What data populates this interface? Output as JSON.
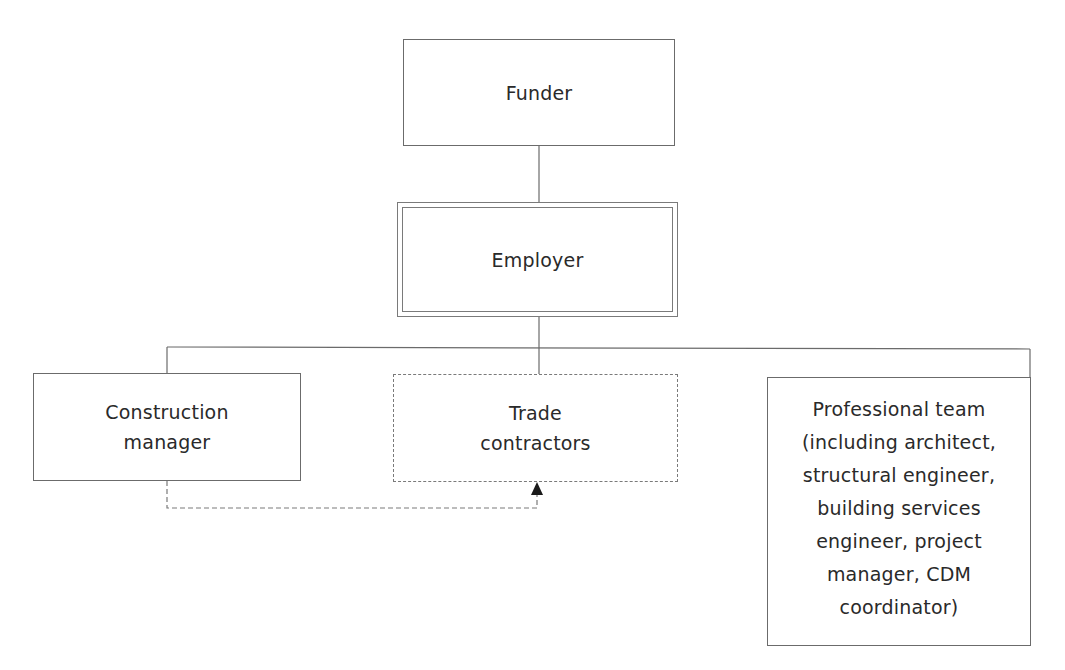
{
  "diagram": {
    "type": "organizational-structure",
    "nodes": {
      "funder": {
        "lines": [
          "Funder"
        ],
        "style": "solid"
      },
      "employer": {
        "lines": [
          "Employer"
        ],
        "style": "double"
      },
      "construction_manager": {
        "lines": [
          "Construction",
          "manager"
        ],
        "style": "solid"
      },
      "trade_contractors": {
        "lines": [
          "Trade",
          "contractors"
        ],
        "style": "dashed"
      },
      "professional_team": {
        "lines": [
          "Professional team",
          "(including architect,",
          "structural engineer,",
          "building services",
          "engineer, project",
          "manager, CDM",
          "coordinator)"
        ],
        "style": "solid"
      }
    },
    "edges": [
      {
        "from": "funder",
        "to": "employer",
        "style": "solid"
      },
      {
        "from": "employer",
        "to": "construction_manager",
        "style": "solid"
      },
      {
        "from": "employer",
        "to": "trade_contractors",
        "style": "solid"
      },
      {
        "from": "employer",
        "to": "professional_team",
        "style": "solid"
      },
      {
        "from": "construction_manager",
        "to": "trade_contractors",
        "style": "dashed",
        "arrow": "end"
      }
    ],
    "colors": {
      "line": "#6b6b6b",
      "text": "#2a2a2a",
      "background": "#ffffff"
    }
  }
}
